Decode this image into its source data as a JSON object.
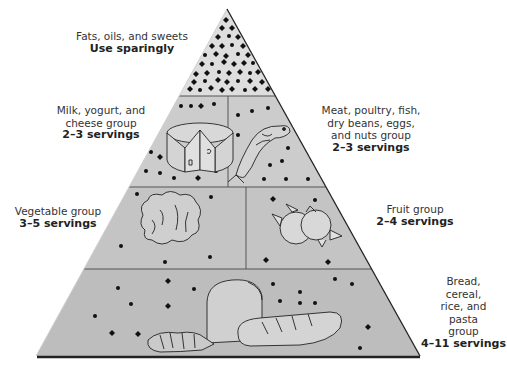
{
  "diagram": {
    "type": "food-guide-pyramid",
    "colors": {
      "tier_fill": "#c9c9c9",
      "tip_fill": "#dcdcdc",
      "outline": "#222222",
      "dot": "#111111",
      "text": "#333333"
    },
    "tiers": [
      {
        "id": "fats",
        "lines": [
          "Fats, oils, and sweets"
        ],
        "servings": "Use sparingly"
      },
      {
        "id": "milk",
        "lines": [
          "Milk, yogurt, and",
          "cheese group"
        ],
        "servings": "2–3 servings"
      },
      {
        "id": "meat",
        "lines": [
          "Meat, poultry, fish,",
          "dry beans, eggs,",
          "and nuts group"
        ],
        "servings": "2–3 servings"
      },
      {
        "id": "vegetable",
        "lines": [
          "Vegetable group"
        ],
        "servings": "3–5 servings"
      },
      {
        "id": "fruit",
        "lines": [
          "Fruit group"
        ],
        "servings": "2–4 servings"
      },
      {
        "id": "bread",
        "lines": [
          "Bread,",
          "cereal,",
          "rice, and",
          "pasta",
          "group"
        ],
        "servings": "4–11 servings"
      }
    ]
  }
}
